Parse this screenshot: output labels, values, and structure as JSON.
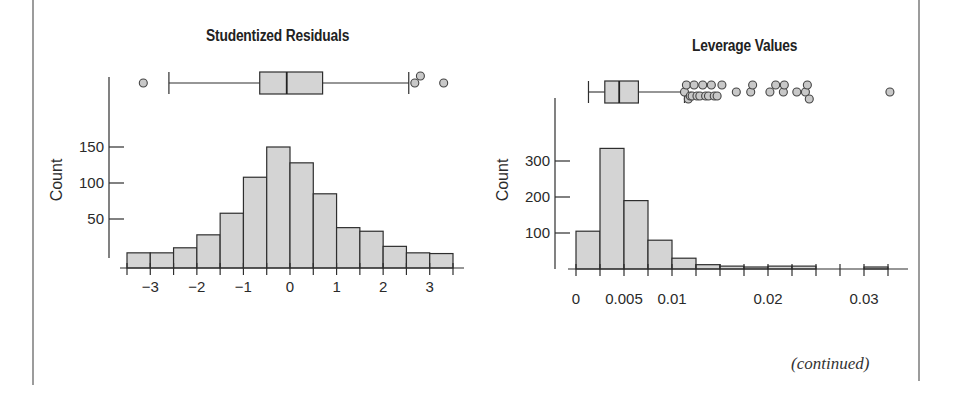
{
  "page": {
    "continued_label": "(continued)"
  },
  "chart_data": [
    {
      "type": "bar",
      "subtype": "histogram_with_boxplot",
      "title": "Studentized Residuals",
      "xlabel": "",
      "ylabel": "Count",
      "x_tick_labels": [
        "−3",
        "−2",
        "−1",
        "0",
        "1",
        "2",
        "3"
      ],
      "x_ticks": [
        -3,
        -2,
        -1,
        0,
        1,
        2,
        3
      ],
      "y_tick_labels": [
        "50",
        "100",
        "150"
      ],
      "y_ticks": [
        50,
        100,
        150
      ],
      "bin_edges": [
        -3.5,
        -3.0,
        -2.5,
        -2.0,
        -1.5,
        -1.0,
        -0.5,
        0.0,
        0.5,
        1.0,
        1.5,
        2.0,
        2.5,
        3.0,
        3.5
      ],
      "categories": [
        "-3.5 to -3",
        "-3 to -2.5",
        "-2.5 to -2",
        "-2 to -1.5",
        "-1.5 to -1",
        "-1 to -0.5",
        "-0.5 to 0",
        "0 to 0.5",
        "0.5 to 1",
        "1 to 1.5",
        "1.5 to 2",
        "2 to 2.5",
        "2.5 to 3",
        "3 to 3.5"
      ],
      "values": [
        3,
        3,
        10,
        28,
        58,
        108,
        150,
        128,
        85,
        38,
        33,
        12,
        3,
        2
      ],
      "xlim": [
        -3.5,
        3.5
      ],
      "ylim": [
        0,
        160
      ],
      "grid": false,
      "legend": null,
      "boxplot": {
        "whisker_low": -2.6,
        "q1": -0.65,
        "median": -0.07,
        "q3": 0.7,
        "whisker_high": 2.55,
        "outliers": [
          -3.15,
          2.68,
          2.8,
          3.3
        ]
      }
    },
    {
      "type": "bar",
      "subtype": "histogram_with_boxplot",
      "title": "Leverage Values",
      "xlabel": "",
      "ylabel": "Count",
      "x_tick_labels": [
        "0",
        "0.005",
        "0.01",
        "0.02",
        "0.03"
      ],
      "x_ticks": [
        0,
        0.005,
        0.01,
        0.02,
        0.03
      ],
      "y_tick_labels": [
        "100",
        "200",
        "300"
      ],
      "y_ticks": [
        100,
        200,
        300
      ],
      "bin_edges": [
        0,
        0.0025,
        0.005,
        0.0075,
        0.01,
        0.0125,
        0.015,
        0.0175,
        0.02,
        0.0225,
        0.025,
        0.0275,
        0.03,
        0.0325
      ],
      "categories": [
        "0-0.0025",
        "0.0025-0.005",
        "0.005-0.0075",
        "0.0075-0.01",
        "0.01-0.0125",
        "0.0125-0.015",
        "0.015-0.0175",
        "0.0175-0.02",
        "0.02-0.0225",
        "0.0225-0.025",
        "0.025-0.0275",
        "0.0275-0.03",
        "0.03-0.0325"
      ],
      "values": [
        105,
        335,
        190,
        80,
        30,
        12,
        8,
        3,
        8,
        8,
        0,
        0,
        3
      ],
      "xlim": [
        0,
        0.0325
      ],
      "ylim": [
        0,
        350
      ],
      "grid": false,
      "legend": null,
      "boxplot": {
        "whisker_low": 0.0013,
        "q1": 0.003,
        "median": 0.0045,
        "q3": 0.0065,
        "whisker_high": 0.0113,
        "outliers": [
          0.0113,
          0.0115,
          0.0117,
          0.0119,
          0.0121,
          0.0123,
          0.0126,
          0.0129,
          0.0132,
          0.0135,
          0.0138,
          0.0141,
          0.0144,
          0.0147,
          0.0152,
          0.0167,
          0.0182,
          0.0184,
          0.0202,
          0.0208,
          0.0216,
          0.0217,
          0.023,
          0.0239,
          0.0241,
          0.0243,
          0.0327
        ]
      }
    }
  ],
  "colors": {
    "bar_fill": "#d4d4d4",
    "bar_stroke": "#2e2e2e",
    "axis": "#2e2e2e",
    "outlier_fill": "#c8c8c8",
    "frame": "#9c9c9c"
  }
}
